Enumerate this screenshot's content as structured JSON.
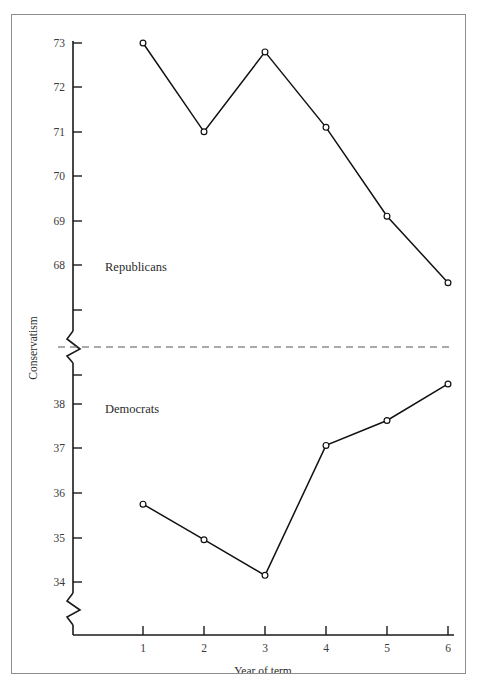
{
  "chart_data": {
    "type": "line",
    "title": "",
    "xlabel": "Year of term",
    "ylabel": "Conservatism",
    "x": [
      1,
      2,
      3,
      4,
      5,
      6
    ],
    "xticklabels": [
      "1",
      "2",
      "3",
      "4",
      "5",
      "6"
    ],
    "grid": false,
    "legend_position": "inline-annotation",
    "broken_axis": true,
    "axis_break_note": "Y axis is broken between the Republican panel (67.0-73.3) and the Democrat panel (33.6-38.8); a dashed horizontal rule separates the two panels.",
    "panels": [
      {
        "name": "Republicans",
        "ylim": [
          67.0,
          73.3
        ],
        "yticks": [
          68,
          69,
          70,
          71,
          72,
          73
        ],
        "yticklabels": [
          "68",
          "69",
          "70",
          "71",
          "72",
          "73"
        ],
        "annotation": "Republicans"
      },
      {
        "name": "Democrats",
        "ylim": [
          33.6,
          38.8
        ],
        "yticks": [
          34,
          35,
          36,
          37,
          38
        ],
        "yticklabels": [
          "34",
          "35",
          "36",
          "37",
          "38"
        ],
        "annotation": "Democrats"
      }
    ],
    "series": [
      {
        "name": "Republicans",
        "panel": "Republicans",
        "marker": "open-circle",
        "color": "#111111",
        "values": [
          73.0,
          71.0,
          72.8,
          71.1,
          69.1,
          67.6
        ]
      },
      {
        "name": "Democrats",
        "panel": "Democrats",
        "marker": "open-circle",
        "color": "#111111",
        "values": [
          35.75,
          34.95,
          34.15,
          37.07,
          37.63,
          38.45
        ]
      }
    ]
  },
  "figure": {
    "border_color": "#8d8d8d",
    "background": "#ffffff",
    "line_color": "#111111"
  }
}
